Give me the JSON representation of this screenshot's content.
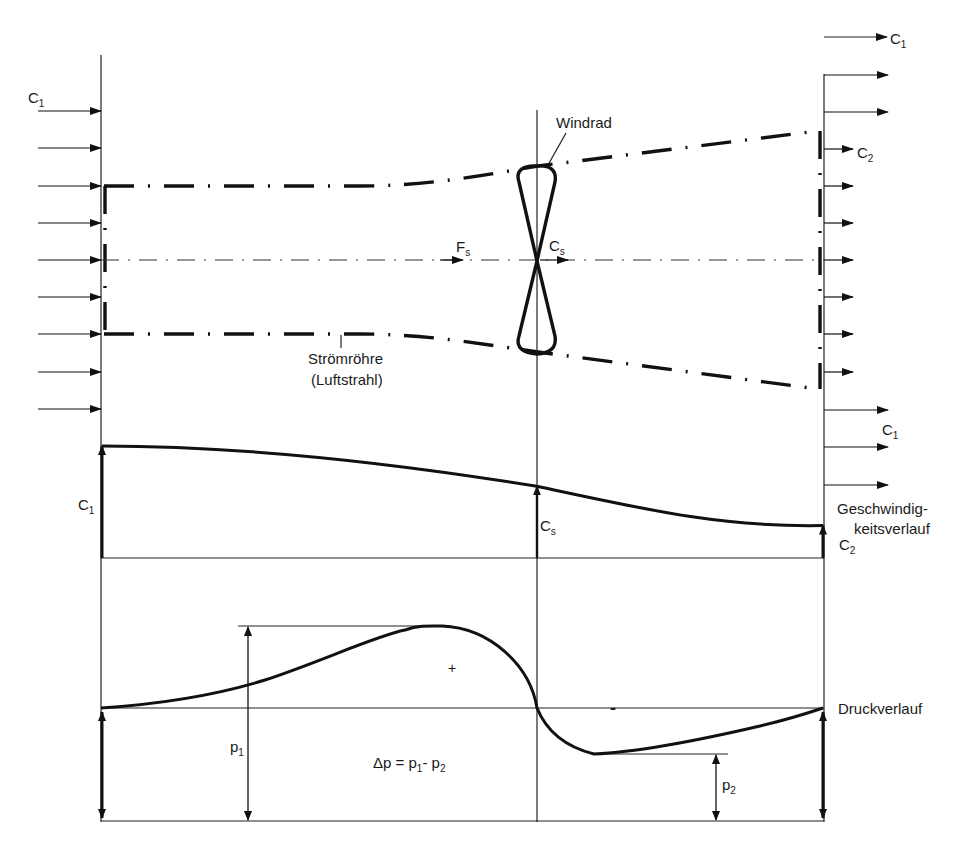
{
  "diagram": {
    "title_region": "Wind turbine stream tube with velocity and pressure profiles",
    "labels": {
      "c1_inlet": {
        "main": "C",
        "sub": "1"
      },
      "c1_top_right": {
        "main": "C",
        "sub": "1"
      },
      "c2_right": {
        "main": "C",
        "sub": "2"
      },
      "c1_right_lower": {
        "main": "C",
        "sub": "1"
      },
      "windrad": "Windrad",
      "fs": {
        "main": "F",
        "sub": "s"
      },
      "cs_top": {
        "main": "C",
        "sub": "s"
      },
      "stromrohre_line1": "Strömröhre",
      "stromrohre_line2": "(Luftstrahl)",
      "c1_velocity": {
        "main": "C",
        "sub": "1"
      },
      "cs_velocity": {
        "main": "C",
        "sub": "s"
      },
      "c2_velocity": {
        "main": "C",
        "sub": "2"
      },
      "velocity_profile_line1": "Geschwindig-",
      "velocity_profile_line2": "keitsverlauf",
      "plus_sign": "+",
      "minus_sign": "-",
      "p1": {
        "main": "p",
        "sub": "1"
      },
      "p2": {
        "main": "p",
        "sub": "2"
      },
      "delta_p": {
        "prefix": "Δp = p",
        "sub1": "1",
        "mid": "- p",
        "sub2": "2"
      },
      "pressure_profile": "Druckverlauf"
    },
    "velocity_profile": {
      "c1_relative": 1.0,
      "cs_relative": 0.64,
      "c2_relative": 0.29
    },
    "pressure_profile": {
      "inlet_relative": 0,
      "p_max_relative": 1.0,
      "rotor_relative": 0,
      "p_min_relative": -0.45,
      "outlet_relative": 0
    }
  }
}
